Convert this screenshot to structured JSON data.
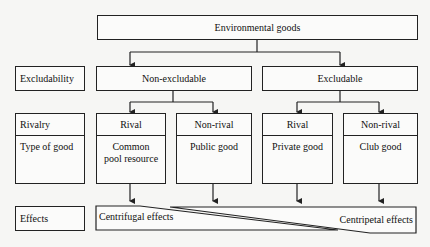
{
  "root": {
    "label": "Environmental goods"
  },
  "row_labels": {
    "excludability": "Excludability",
    "rivalry": "Rivalry",
    "type_of_good": "Type of good",
    "effects": "Effects"
  },
  "excludability": [
    {
      "label": "Non-excludable"
    },
    {
      "label": "Excludable"
    }
  ],
  "goods": [
    {
      "rivalry": "Rival",
      "type": "Common pool resource"
    },
    {
      "rivalry": "Non-rival",
      "type": "Public good"
    },
    {
      "rivalry": "Rival",
      "type": "Private good"
    },
    {
      "rivalry": "Non-rival",
      "type": "Club good"
    }
  ],
  "effects": {
    "left": "Centrifugal effects",
    "right": "Centripetal effects"
  },
  "colors": {
    "line": "#222222",
    "background": "#f6f6f4"
  }
}
